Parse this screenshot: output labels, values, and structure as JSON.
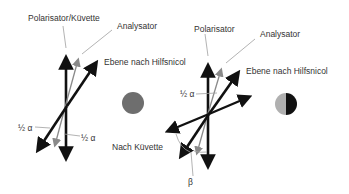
{
  "colors": {
    "thick_line": "#111111",
    "thin_line": "#8a8a8a",
    "leader_line": "#a0a0a0",
    "circle_uniform": "#6e6e6e",
    "circle_light_half": "#b0b0b0",
    "circle_dark_half": "#111111",
    "text": "#333333"
  },
  "left_diagram": {
    "labels": {
      "polarisator_kuevette": "Polarisator/Küvette",
      "analysator": "Analysator",
      "ebene_hilfsnicol": "Ebene nach Hilfsnicol",
      "half_alpha_left": "½ α",
      "half_alpha_right": "½ α"
    },
    "field_of_view": "uniform-gray"
  },
  "right_diagram": {
    "labels": {
      "polarisator": "Polarisator",
      "analysator": "Analysator",
      "ebene_hilfsnicol": "Ebene nach Hilfsnicol",
      "half_alpha": "½ α",
      "nach_kuevette": "Nach Küvette",
      "beta": "β"
    },
    "field_of_view": "half-light-half-dark"
  }
}
